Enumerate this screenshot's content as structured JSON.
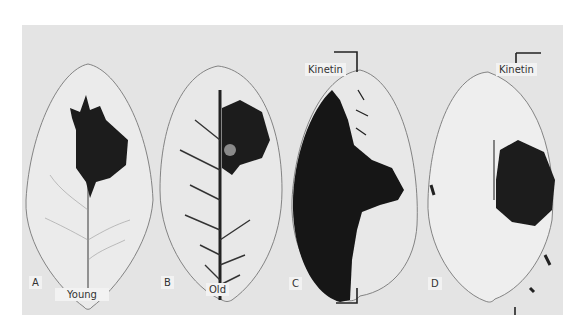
{
  "figure": {
    "panels": [
      {
        "letter": "A",
        "caption": "Young"
      },
      {
        "letter": "B",
        "caption": "Old"
      },
      {
        "letter": "C",
        "treatment": "Kinetin"
      },
      {
        "letter": "D",
        "treatment": "Kinetin"
      }
    ]
  }
}
